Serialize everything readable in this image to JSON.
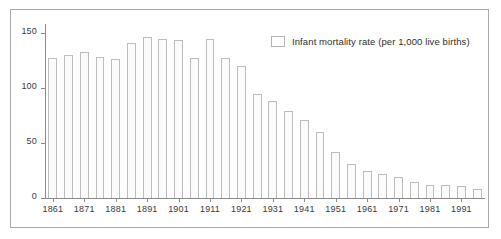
{
  "chart_data": {
    "type": "bar",
    "title": "",
    "subtitle": "",
    "xlabel": "",
    "ylabel": "",
    "ylim": [
      0,
      160
    ],
    "yticks": [
      0,
      50,
      100,
      150
    ],
    "ytick_labels": [
      "0",
      "50",
      "100",
      "150"
    ],
    "grid": false,
    "legend_position": "top-right",
    "legend": [
      {
        "label": "Infant mortality rate (per 1,000 live births)",
        "swatch_fill": "#ffffff",
        "swatch_border": "#b4b4b4"
      }
    ],
    "categories": [
      "1861",
      "1866",
      "1871",
      "1876",
      "1881",
      "1886",
      "1891",
      "1896",
      "1901",
      "1906",
      "1911",
      "1916",
      "1921",
      "1926",
      "1931",
      "1936",
      "1941",
      "1946",
      "1951",
      "1956",
      "1961",
      "1966",
      "1971",
      "1976",
      "1981",
      "1986",
      "1991",
      "1996"
    ],
    "xtick_labels": [
      "1861",
      "1871",
      "1881",
      "1891",
      "1901",
      "1911",
      "1921",
      "1931",
      "1941",
      "1951",
      "1961",
      "1971",
      "1981",
      "1991"
    ],
    "values": [
      127,
      130,
      133,
      128,
      126,
      141,
      146,
      145,
      144,
      127,
      145,
      127,
      120,
      95,
      88,
      79,
      71,
      60,
      42,
      31,
      25,
      22,
      19,
      15,
      12,
      12,
      11,
      8
    ],
    "series": [
      {
        "name": "Infant mortality rate (per 1,000 live births)",
        "values": [
          127,
          130,
          133,
          128,
          126,
          141,
          146,
          145,
          144,
          127,
          145,
          127,
          120,
          95,
          88,
          79,
          71,
          60,
          42,
          31,
          25,
          22,
          19,
          15,
          12,
          12,
          11,
          8
        ]
      }
    ]
  }
}
